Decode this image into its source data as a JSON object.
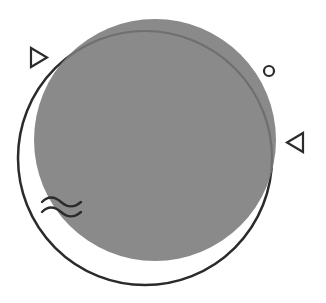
{
  "illustration": {
    "background": "#ffffff",
    "main_circle": {
      "cx": 155,
      "cy": 140,
      "r": 121,
      "fill": "#8a8a8a"
    },
    "outline_circle": {
      "cx": 145,
      "cy": 158,
      "r": 127,
      "stroke": "#2b2b2b",
      "stroke_inside": "#6f6f6f",
      "stroke_width": 2.5
    },
    "triangle_right": {
      "points": "31,48 31,67 47,57.5",
      "stroke": "#2b2b2b",
      "icon": "play-triangle-outline"
    },
    "small_circle": {
      "cx": 269,
      "cy": 71,
      "r": 5,
      "stroke": "#2b2b2b",
      "icon": "ring-outline"
    },
    "triangle_left": {
      "points": "303,133 303,152 287,142.5",
      "stroke": "#2b2b2b",
      "icon": "left-triangle-outline"
    },
    "waves": {
      "x": 41,
      "y": 200,
      "color": "#2b2b2b",
      "icon": "wave-lines"
    }
  }
}
